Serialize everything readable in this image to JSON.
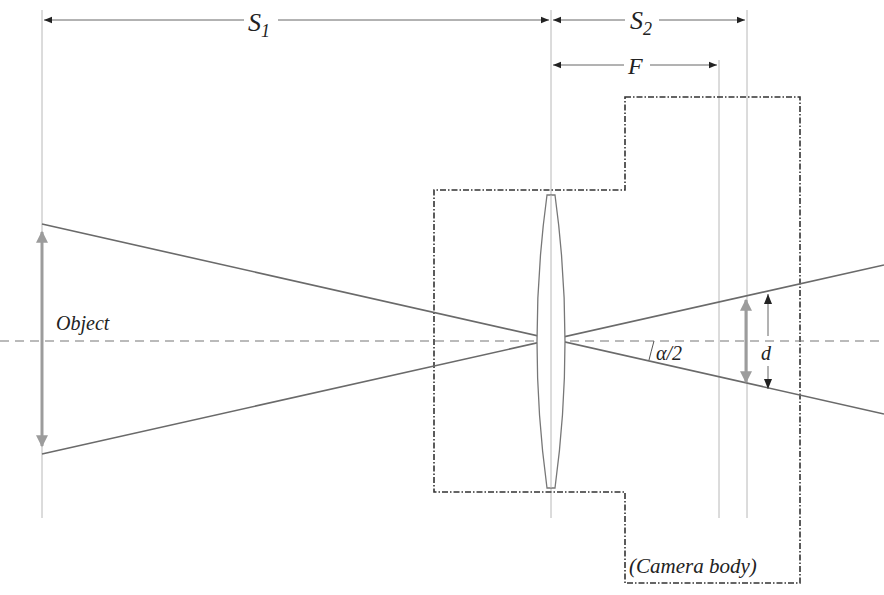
{
  "diagram": {
    "labels": {
      "s1_main": "S",
      "s1_sub": "1",
      "s2_main": "S",
      "s2_sub": "2",
      "focal": "F",
      "object": "Object",
      "half_angle": "α/2",
      "image_size": "d",
      "camera_body": "(Camera body)"
    },
    "colors": {
      "ray": "#6a6a6a",
      "axis": "#777777",
      "object_arrow": "#9c9c9c",
      "camera_body": "#333333",
      "guide_line": "#b8b8b8"
    }
  }
}
